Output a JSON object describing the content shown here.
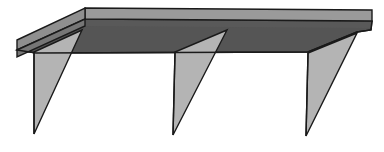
{
  "figure": {
    "view": "three-quarter perspective, viewed from below-front",
    "background_color": "#ffffff",
    "outline_color": "#1a1a1a",
    "canvas": {
      "width": 384,
      "height": 152
    }
  },
  "palette": {
    "shelf_top_surface": "#555555",
    "shelf_top_surface_dark": "#4d4d4d",
    "shelf_edge_band": "#9a9a9a",
    "shelf_end_face": "#8a8a8a",
    "bracket_face": "#b4b4b4",
    "bracket_face_shaded": "#a8a8a8",
    "bracket_side_edge": "#8d8d8d",
    "outline": "#1a1a1a",
    "background": "#ffffff"
  },
  "parts": [
    {
      "id": "shelf-board",
      "label": "Shelf board",
      "description": "Large flat rectangular panel seen in perspective; dark gray underside plane with a lighter gray front edge band running along its back-top.",
      "fill": "#555555"
    },
    {
      "id": "shelf-edge-band",
      "label": "Shelf front edge band",
      "description": "Thin light gray strip along the upper edge of the board representing the board thickness.",
      "fill": "#9a9a9a"
    },
    {
      "id": "shelf-end-face",
      "label": "Shelf left end face",
      "description": "Small light gray parallelogram at the far left showing the cut end of the board.",
      "fill": "#8a8a8a"
    },
    {
      "id": "bracket-left",
      "label": "Left support bracket",
      "description": "Right-triangle gusset bracket; vertical edge against the wall, hypotenuse sloping up to the right.",
      "fill": "#b4b4b4"
    },
    {
      "id": "bracket-center",
      "label": "Center support bracket",
      "description": "Right-triangle gusset bracket at the middle of the span.",
      "fill": "#b4b4b4"
    },
    {
      "id": "bracket-right",
      "label": "Right support bracket",
      "description": "Right-triangle gusset bracket near the right end of the shelf.",
      "fill": "#b4b4b4"
    }
  ],
  "geometry": {
    "shelf": {
      "top_band": {
        "points": "85,8 372,10 372,22 85,20",
        "note": "light band across the top of the board"
      },
      "top_surface": {
        "points": "85,20 372,22 357,33 307,52 36,53 17,50",
        "note": "dark underside plane of the shelf"
      },
      "left_wing_top": {
        "points": "17,40 85,8 85,20 17,50",
        "note": "left overhang end, light face"
      },
      "left_wing_edge": {
        "points": "17,50 85,20 85,27 17,57",
        "note": "left overhang lower edge, darker"
      }
    },
    "brackets": [
      {
        "id": "bracket-left",
        "apex": [
          82,
          30
        ],
        "wall_top": [
          34,
          52
        ],
        "wall_bottom": [
          34,
          134
        ],
        "spine_x": 34,
        "points": "82,30 34,52 34,134"
      },
      {
        "id": "bracket-center",
        "apex": [
          227,
          30
        ],
        "wall_top": [
          175,
          52
        ],
        "wall_bottom": [
          173,
          135
        ],
        "spine_x": 175,
        "points": "227,30 175,52 173,135"
      },
      {
        "id": "bracket-right",
        "apex": [
          357,
          33
        ],
        "wall_top": [
          308,
          53
        ],
        "wall_bottom": [
          306,
          136
        ],
        "spine_x": 308,
        "points": "357,33 308,53 306,136"
      }
    ]
  },
  "counts": {
    "brackets": 3,
    "shelf_boards": 1
  },
  "labels": {
    "caption": ""
  }
}
